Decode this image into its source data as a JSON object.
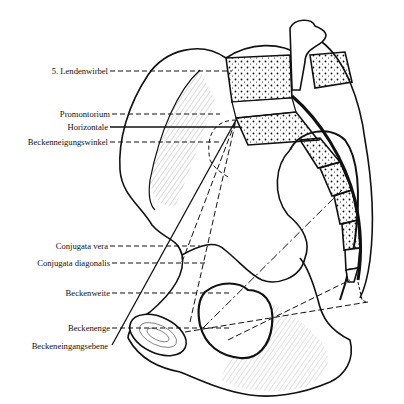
{
  "figure": {
    "colors": {
      "ink": "#111111",
      "background": "#ffffff"
    },
    "labels": [
      {
        "id": "lendenwirbel",
        "text": "5. Lendenwirbel",
        "line": "dashed"
      },
      {
        "id": "promontorium",
        "text": "Promontorium",
        "line": "dashed"
      },
      {
        "id": "horizontale",
        "text": "Horizontale",
        "line": "solid"
      },
      {
        "id": "beckenneigungswinkel",
        "text": "Beckenneigungswinkel",
        "line": "dashed"
      },
      {
        "id": "conjugata-vera",
        "text": "Conjugata vera",
        "line": "dashed"
      },
      {
        "id": "conjugata-diagonalis",
        "text": "Conjugata diagonalis",
        "line": "dashed"
      },
      {
        "id": "beckenweite",
        "text": "Beckenweite",
        "line": "dashed"
      },
      {
        "id": "beckenenge",
        "text": "Beckenenge",
        "line": "dashed"
      },
      {
        "id": "beckeneingangsebene",
        "text": "Beckeneingangsebene",
        "line": "solid"
      }
    ]
  }
}
